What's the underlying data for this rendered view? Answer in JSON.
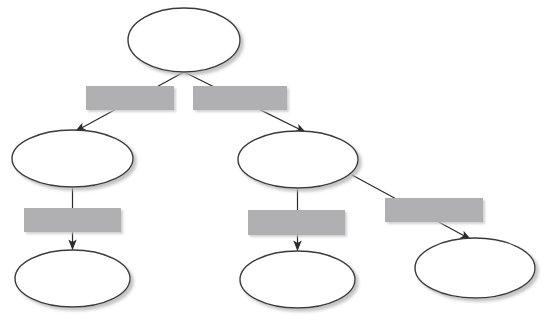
{
  "diagram": {
    "title": "",
    "type": "flowchart-tree",
    "canvas": {
      "width": 551,
      "height": 321,
      "background": "#ffffff"
    },
    "style": {
      "ellipse_fill": "#ffffff",
      "ellipse_stroke": "#3a3a3a",
      "ellipse_stroke_width": 1.4,
      "box_fill": "#b0b0b3",
      "box_stroke": "none",
      "connector_color": "#2b2b2b",
      "connector_width": 1.2,
      "shadow_color": "#c9c9c9"
    },
    "nodes": [
      {
        "id": "n1",
        "shape": "ellipse",
        "label": "",
        "cx": 184,
        "cy": 40,
        "rx": 56,
        "ry": 32
      },
      {
        "id": "n2",
        "shape": "ellipse",
        "label": "",
        "cx": 72.5,
        "cy": 158.5,
        "rx": 60.5,
        "ry": 28.5
      },
      {
        "id": "n3",
        "shape": "ellipse",
        "label": "",
        "cx": 298,
        "cy": 159.5,
        "rx": 60,
        "ry": 28.5
      },
      {
        "id": "n4",
        "shape": "ellipse",
        "label": "",
        "cx": 72.5,
        "cy": 278.5,
        "rx": 57.5,
        "ry": 28.5
      },
      {
        "id": "n5",
        "shape": "ellipse",
        "label": "",
        "cx": 297.5,
        "cy": 279.5,
        "rx": 57.5,
        "ry": 28.5
      },
      {
        "id": "n6",
        "shape": "ellipse",
        "label": "",
        "cx": 475,
        "cy": 268,
        "rx": 60,
        "ry": 30
      }
    ],
    "boxes": [
      {
        "id": "b1",
        "shape": "rect",
        "label": "",
        "x": 86,
        "y": 86,
        "width": 88,
        "height": 24
      },
      {
        "id": "b2",
        "shape": "rect",
        "label": "",
        "x": 193,
        "y": 86,
        "width": 94,
        "height": 24
      },
      {
        "id": "b3",
        "shape": "rect",
        "label": "",
        "x": 24,
        "y": 208,
        "width": 97,
        "height": 24
      },
      {
        "id": "b4",
        "shape": "rect",
        "label": "",
        "x": 248,
        "y": 210,
        "width": 97,
        "height": 25
      },
      {
        "id": "b5",
        "shape": "rect",
        "label": "",
        "x": 385,
        "y": 198,
        "width": 98,
        "height": 24
      }
    ],
    "edges": [
      {
        "id": "e1",
        "from": "n1",
        "to": "n2",
        "label": "",
        "x1": 184,
        "y1": 72,
        "x2": 76,
        "y2": 131,
        "arrow": true
      },
      {
        "id": "e2",
        "from": "n1",
        "to": "n3",
        "label": "",
        "x1": 184,
        "y1": 72,
        "x2": 305,
        "y2": 132,
        "arrow": true
      },
      {
        "id": "e3",
        "from": "n2",
        "to": "n4",
        "label": "",
        "x1": 72.5,
        "y1": 187,
        "x2": 72.5,
        "y2": 249,
        "arrow": true
      },
      {
        "id": "e4",
        "from": "n3",
        "to": "n5",
        "label": "",
        "x1": 297.5,
        "y1": 188,
        "x2": 297.5,
        "y2": 250,
        "arrow": true
      },
      {
        "id": "e5",
        "from": "n3",
        "to": "n6",
        "label": "",
        "x1": 352,
        "y1": 175,
        "x2": 470,
        "y2": 239,
        "arrow": true
      }
    ]
  }
}
